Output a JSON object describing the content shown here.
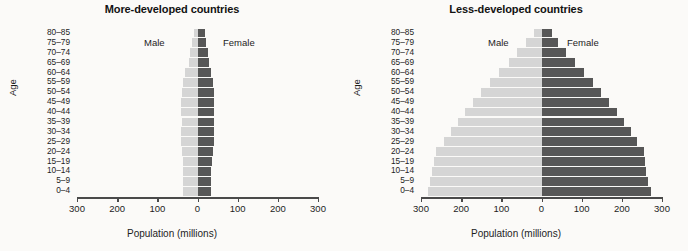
{
  "figure": {
    "axis_x_label": "Population (millions)",
    "axis_y_label": "Age",
    "male_label": "Male",
    "female_label": "Female",
    "male_color": "#d5d5d5",
    "female_color": "#575757",
    "tick_labels": [
      "300",
      "200",
      "100",
      "0",
      "100",
      "200",
      "300"
    ],
    "age_groups": [
      "80–85",
      "75–79",
      "70–74",
      "65–69",
      "60–64",
      "55–59",
      "50–54",
      "45–49",
      "40–44",
      "35–39",
      "30–34",
      "25–29",
      "20–24",
      "15–19",
      "10–14",
      "5–9",
      "0–4"
    ]
  },
  "chart_data": [
    {
      "type": "bar",
      "title": "More-developed countries",
      "xlabel": "Population (millions)",
      "ylabel": "Age",
      "xlim": [
        -300,
        300
      ],
      "grid": false,
      "legend_position": "inside-top",
      "categories": [
        "80–85",
        "75–79",
        "70–74",
        "65–69",
        "60–64",
        "55–59",
        "50–54",
        "45–49",
        "40–44",
        "35–39",
        "30–34",
        "25–29",
        "20–24",
        "15–19",
        "10–14",
        "5–9",
        "0–4"
      ],
      "series": [
        {
          "name": "Male",
          "values": [
            9,
            14,
            18,
            22,
            31,
            36,
            38,
            41,
            40,
            39,
            40,
            40,
            38,
            36,
            36,
            36,
            36
          ]
        },
        {
          "name": "Female",
          "values": [
            18,
            22,
            26,
            28,
            34,
            38,
            40,
            42,
            41,
            40,
            40,
            40,
            38,
            35,
            34,
            34,
            34
          ]
        }
      ]
    },
    {
      "type": "bar",
      "title": "Less-developed countries",
      "xlabel": "Population (millions)",
      "ylabel": "Age",
      "xlim": [
        -300,
        300
      ],
      "grid": false,
      "legend_position": "inside-top",
      "categories": [
        "80–85",
        "75–79",
        "70–74",
        "65–69",
        "60–64",
        "55–59",
        "50–54",
        "45–49",
        "40–44",
        "35–39",
        "30–34",
        "25–29",
        "20–24",
        "15–19",
        "10–14",
        "5–9",
        "0–4"
      ],
      "series": [
        {
          "name": "Male",
          "values": [
            18,
            38,
            60,
            82,
            105,
            128,
            150,
            170,
            190,
            208,
            225,
            243,
            262,
            268,
            272,
            278,
            283
          ]
        },
        {
          "name": "Female",
          "values": [
            25,
            42,
            62,
            84,
            107,
            128,
            148,
            168,
            188,
            205,
            222,
            238,
            254,
            258,
            261,
            265,
            272
          ]
        }
      ]
    }
  ]
}
